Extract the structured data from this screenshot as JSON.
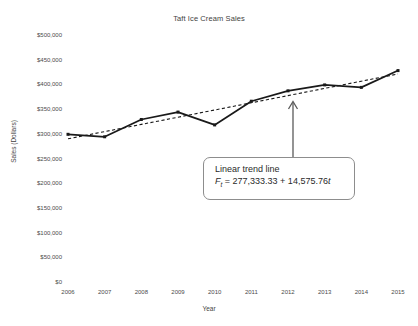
{
  "chart_data": {
    "type": "line",
    "title": "Taft Ice Cream Sales",
    "xlabel": "Year",
    "ylabel": "Sales (Dollars)",
    "categories": [
      "2006",
      "2007",
      "2008",
      "2009",
      "2010",
      "2011",
      "2012",
      "2013",
      "2014",
      "2015"
    ],
    "ylim": [
      0,
      500000
    ],
    "ytick_labels": [
      "$500,000",
      "$450,000",
      "$400,000",
      "$350,000",
      "$300,000",
      "$250,000",
      "$200,000",
      "$150,000",
      "$100,000",
      "$50,000",
      "$0"
    ],
    "ytick_values": [
      500000,
      450000,
      400000,
      350000,
      300000,
      250000,
      200000,
      150000,
      100000,
      50000,
      0
    ],
    "grid": false,
    "legend": "none",
    "series": [
      {
        "name": "Sales",
        "style": "solid-with-markers",
        "color": "#1a1a1a",
        "values": [
          301000,
          296000,
          331000,
          346000,
          320000,
          368000,
          389000,
          401000,
          396000,
          430000
        ]
      },
      {
        "name": "Linear trend line",
        "style": "dashed",
        "color": "#1a1a1a",
        "values": [
          291909,
          306485,
          321061,
          335636,
          350212,
          364788,
          379364,
          393939,
          408515,
          423091
        ]
      }
    ],
    "annotations": [
      {
        "name": "trend-callout",
        "line1": "Linear trend line",
        "equation_lhs": "F",
        "equation_sub": "t",
        "equation_rhs": " = 277,333.33 + 14,575.76",
        "equation_var": "t",
        "points_to_year": "2012"
      }
    ]
  },
  "colors": {
    "background": "#ffffff",
    "text": "#3f3f3f",
    "line": "#1a1a1a",
    "callout_border": "#8d8d8d"
  }
}
